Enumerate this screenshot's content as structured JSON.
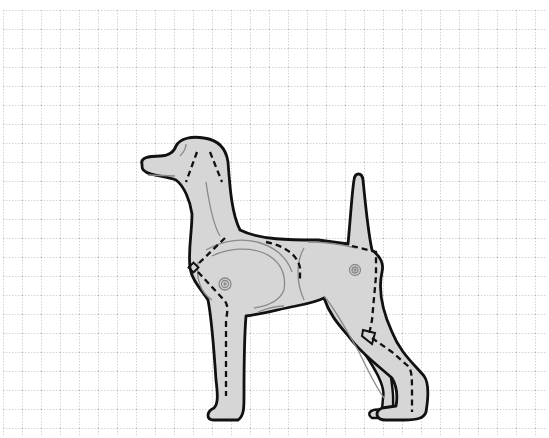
{
  "figure": {
    "title": "Dog body outline on grid with dashed cut/seam lines",
    "colors": {
      "background": "#ffffff",
      "grid": "#a9a9a9",
      "body_fill": "#d6d6d6",
      "outline": "#111111",
      "inner_line": "#8a8a8a",
      "dashed_line": "#111111"
    },
    "grid": {
      "origin_x": 3,
      "origin_y": 10,
      "spacing": 19,
      "style": "dotted"
    },
    "parts": [
      "head",
      "neck",
      "ear-tail",
      "shoulder",
      "hip",
      "front-legs",
      "hind-legs"
    ],
    "markers": [
      "front-joint-marker",
      "hip-joint-marker",
      "shoulder-diamond",
      "hock-triangle"
    ]
  }
}
